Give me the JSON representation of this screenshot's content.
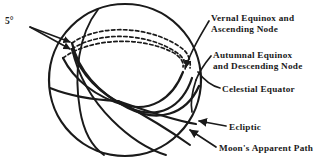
{
  "figure": {
    "background_color": "#ffffff",
    "ink_color": "#1a1a1a"
  },
  "labels": {
    "angle": "5°",
    "vernal_line1": "Vernal Equinox and",
    "vernal_line2": "Ascending  Node",
    "autumnal_line1": "Autumnal  Equinox",
    "autumnal_line2": "and  Descending  Node",
    "celestial_equator": "Celestial Equator",
    "ecliptic": "Ecliptic",
    "moon_path": "Moon's Apparent Path"
  },
  "geometry": {
    "sphere_center_x": 125,
    "sphere_center_y": 80,
    "sphere_radius": 76,
    "ascending_node_x": 72,
    "ascending_node_y": 49,
    "descending_node_x": 183,
    "descending_node_y": 72,
    "front_crossing_x": 118,
    "front_crossing_y": 100
  },
  "elements": {
    "sphere_outline": "celestial-sphere-outline",
    "equator_front": "celestial-equator-front-arc",
    "equator_back": "celestial-equator-back-arc-dashed",
    "ecliptic_front": "ecliptic-front-arc",
    "ecliptic_back": "ecliptic-back-arc-dashed",
    "moon_front": "moon-path-front-arc",
    "moon_back": "moon-path-back-arc-dashed",
    "meridian": "sphere-meridian-arc"
  }
}
